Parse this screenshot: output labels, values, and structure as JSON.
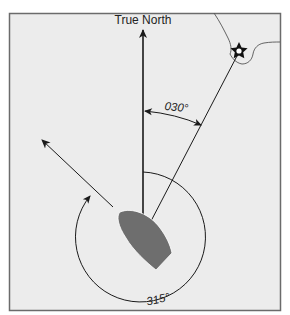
{
  "diagram": {
    "north_label": "True North",
    "bearing_label": "030°",
    "heading_label": "315°",
    "colors": {
      "frame_border": "#6b6b6b",
      "background": "#ececec",
      "boat": "#6e6e6e",
      "lines": "#1a1a1a"
    },
    "elements": {
      "north_arrow": "True North reference line",
      "bearing_line": "Line of bearing from boat to landmark",
      "heading_arrow": "Boat heading direction",
      "landmark": "star-shaped landmark on coastline",
      "coastline": "shoreline outline"
    }
  }
}
